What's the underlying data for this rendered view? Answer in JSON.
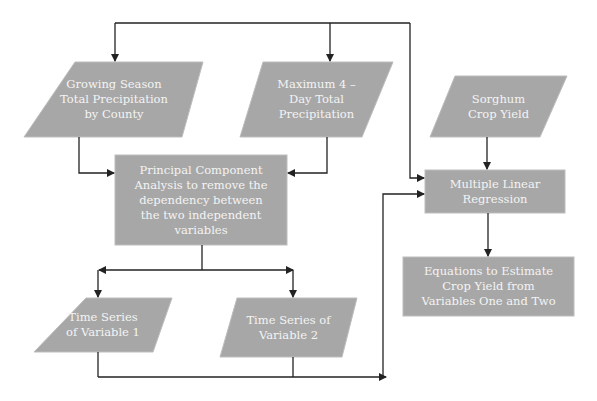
{
  "colors": {
    "node_fill": "#a7a7a7",
    "node_border": "#b9b9b9",
    "text": "#f4f4f4",
    "line": "#222222",
    "background": "#ffffff"
  },
  "nodes": {
    "growing_season": {
      "shape": "parallelogram",
      "label": "Growing Season\nTotal Precipitation\nby County"
    },
    "max_4day": {
      "shape": "parallelogram",
      "label": "Maximum 4 –\nDay Total\nPrecipitation"
    },
    "sorghum": {
      "shape": "parallelogram",
      "label": "Sorghum\nCrop Yield"
    },
    "pca": {
      "shape": "rectangle",
      "label": "Principal Component\nAnalysis to remove the\ndependency between\nthe two independent\nvariables"
    },
    "mlr": {
      "shape": "rectangle",
      "label": "Multiple Linear\nRegression"
    },
    "equations": {
      "shape": "rectangle",
      "label": "Equations to Estimate\nCrop Yield from\nVariables One and Two"
    },
    "ts1": {
      "shape": "parallelogram",
      "label": "Time Series\nof Variable 1"
    },
    "ts2": {
      "shape": "parallelogram",
      "label": "Time Series of\nVariable 2"
    }
  },
  "edges": [
    {
      "from": "top-bus",
      "to": "growing_season"
    },
    {
      "from": "top-bus",
      "to": "max_4day"
    },
    {
      "from": "top-bus",
      "to": "mlr"
    },
    {
      "from": "growing_season",
      "to": "pca"
    },
    {
      "from": "max_4day",
      "to": "pca"
    },
    {
      "from": "sorghum",
      "to": "mlr"
    },
    {
      "from": "pca",
      "to": "ts1"
    },
    {
      "from": "pca",
      "to": "ts2"
    },
    {
      "from": "ts1",
      "to": "mlr"
    },
    {
      "from": "ts2",
      "to": "mlr"
    },
    {
      "from": "mlr",
      "to": "equations"
    }
  ]
}
